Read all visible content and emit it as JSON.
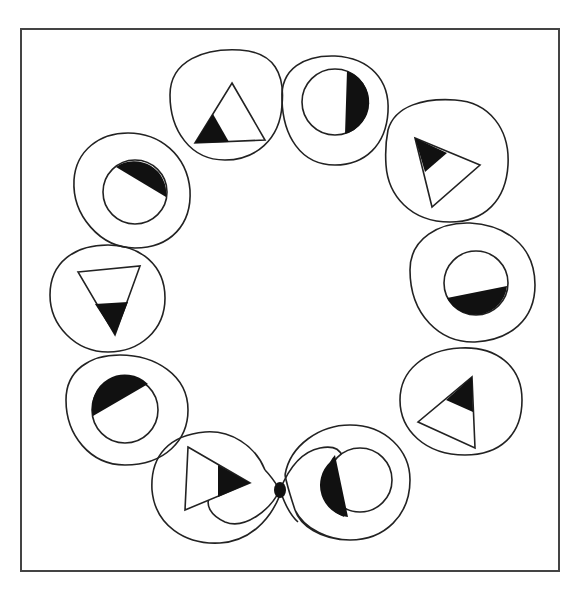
{
  "figure": {
    "frame": {
      "x": 21,
      "y": 29,
      "width": 538,
      "height": 542
    },
    "stroke_color": "#222222",
    "fill_color": "#111111",
    "background": "#ffffff",
    "cells": [
      {
        "id": 1,
        "kind": "triangle",
        "orientation": "up",
        "shaded": "bottom-left corner",
        "cx": 230,
        "cy": 108
      },
      {
        "id": 2,
        "kind": "circle",
        "shaded": "right segment",
        "cx": 330,
        "cy": 112
      },
      {
        "id": 3,
        "kind": "triangle",
        "orientation": "right",
        "shaded": "top-left corner",
        "cx": 445,
        "cy": 160
      },
      {
        "id": 4,
        "kind": "circle",
        "shaded": "bottom segment",
        "cx": 470,
        "cy": 283
      },
      {
        "id": 5,
        "kind": "triangle",
        "orientation": "up-left",
        "shaded": "top corner",
        "cx": 452,
        "cy": 400
      },
      {
        "id": 6,
        "kind": "circle",
        "shaded": "left segment",
        "cx": 345,
        "cy": 475
      },
      {
        "id": 7,
        "kind": "triangle",
        "orientation": "right",
        "shaded": "right tip",
        "cx": 210,
        "cy": 480
      },
      {
        "id": 8,
        "kind": "circle",
        "shaded": "upper-left segment",
        "cx": 117,
        "cy": 405
      },
      {
        "id": 9,
        "kind": "triangle",
        "orientation": "down",
        "shaded": "bottom tip",
        "cx": 108,
        "cy": 295
      },
      {
        "id": 10,
        "kind": "circle",
        "shaded": "upper-right segment",
        "cx": 128,
        "cy": 195
      }
    ],
    "junction_dot": {
      "cx": 280,
      "cy": 490
    }
  },
  "caption": ""
}
